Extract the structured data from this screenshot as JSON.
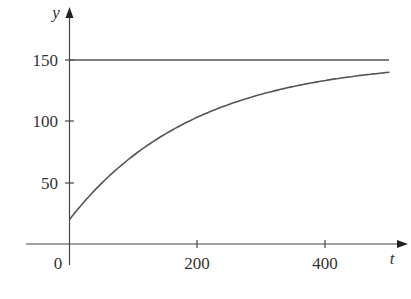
{
  "chart_data": {
    "type": "line",
    "title": "",
    "xlabel": "t",
    "ylabel": "y",
    "xlim": [
      0,
      500
    ],
    "ylim": [
      0,
      170
    ],
    "x_ticks": [
      200,
      400
    ],
    "y_ticks": [
      50,
      100,
      150
    ],
    "origin_label": "0",
    "grid": false,
    "legend": null,
    "series": [
      {
        "name": "equilibrium",
        "x": [
          0,
          500
        ],
        "values": [
          150,
          150
        ]
      },
      {
        "name": "solution curve",
        "x": [
          0,
          50,
          100,
          150,
          200,
          250,
          300,
          350,
          400,
          450,
          500
        ],
        "values": [
          20,
          49,
          71,
          89,
          102,
          113,
          121,
          127,
          132,
          136,
          139
        ]
      }
    ]
  },
  "labels": {
    "x_axis": "t",
    "y_axis": "y",
    "origin": "0",
    "xtick_200": "200",
    "xtick_400": "400",
    "ytick_50": "50",
    "ytick_100": "100",
    "ytick_150": "150"
  }
}
